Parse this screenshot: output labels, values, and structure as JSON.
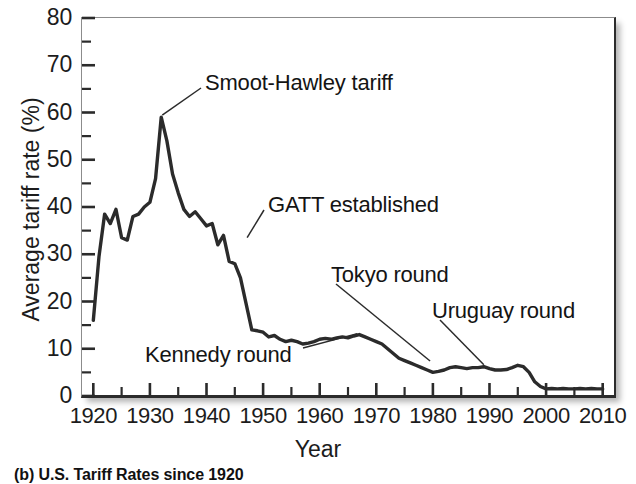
{
  "figure": {
    "caption": "(b)  U.S. Tariff Rates since 1920"
  },
  "axes": {
    "y_title": "Average tariff rate (%)",
    "x_title": "Year",
    "y_ticks": [
      "0",
      "10",
      "20",
      "30",
      "40",
      "50",
      "60",
      "70",
      "80"
    ],
    "x_ticks": [
      "1920",
      "1930",
      "1940",
      "1950",
      "1960",
      "1970",
      "1980",
      "1990",
      "2000",
      "2010"
    ]
  },
  "annotations": [
    {
      "id": "smoot-hawley",
      "label": "Smoot-Hawley tariff",
      "year": 1932,
      "value": 59
    },
    {
      "id": "gatt",
      "label": "GATT established",
      "year": 1947,
      "value": 33
    },
    {
      "id": "kennedy",
      "label": "Kennedy round",
      "year": 1967,
      "value": 12
    },
    {
      "id": "tokyo",
      "label": "Tokyo round",
      "year": 1979,
      "value": 7
    },
    {
      "id": "uruguay",
      "label": "Uruguay round",
      "year": 1989,
      "value": 6
    }
  ],
  "chart_data": {
    "type": "line",
    "title": "",
    "subtitle": "",
    "xlabel": "Year",
    "ylabel": "Average tariff rate (%)",
    "xlim": [
      1918,
      2012
    ],
    "ylim": [
      0,
      80
    ],
    "ytick_step": 10,
    "ytick_minor_step": 5,
    "xtick_step": 10,
    "xtick_minor_step": 5,
    "grid": false,
    "legend": "none",
    "line_color": "#2b2b2b",
    "series": [
      {
        "name": "U.S. average tariff rate",
        "x": [
          1920,
          1921,
          1922,
          1923,
          1924,
          1925,
          1926,
          1927,
          1928,
          1929,
          1930,
          1931,
          1932,
          1933,
          1934,
          1935,
          1936,
          1937,
          1938,
          1939,
          1940,
          1941,
          1942,
          1943,
          1944,
          1945,
          1946,
          1947,
          1948,
          1949,
          1950,
          1951,
          1952,
          1953,
          1954,
          1955,
          1956,
          1957,
          1958,
          1959,
          1960,
          1961,
          1962,
          1963,
          1964,
          1965,
          1966,
          1967,
          1968,
          1969,
          1970,
          1971,
          1972,
          1973,
          1974,
          1975,
          1976,
          1977,
          1978,
          1979,
          1980,
          1981,
          1982,
          1983,
          1984,
          1985,
          1986,
          1987,
          1988,
          1989,
          1990,
          1991,
          1992,
          1993,
          1994,
          1995,
          1996,
          1997,
          1998,
          1999,
          2000,
          2001,
          2002,
          2003,
          2004,
          2005,
          2006,
          2007,
          2008,
          2009,
          2010
        ],
        "values": [
          16.0,
          29.5,
          38.5,
          36.5,
          39.5,
          33.5,
          33.0,
          38.0,
          38.5,
          40.0,
          41.0,
          46.0,
          59.0,
          54.0,
          47.0,
          43.0,
          39.5,
          38.0,
          39.0,
          37.5,
          36.0,
          36.5,
          32.0,
          34.0,
          28.5,
          28.0,
          25.0,
          19.5,
          14.0,
          13.8,
          13.5,
          12.5,
          12.8,
          12.0,
          11.5,
          11.8,
          11.5,
          11.0,
          11.2,
          11.5,
          12.0,
          12.2,
          12.0,
          12.3,
          12.5,
          12.3,
          12.7,
          13.0,
          12.5,
          12.0,
          11.5,
          11.0,
          10.0,
          9.0,
          8.0,
          7.5,
          7.0,
          6.5,
          6.0,
          5.5,
          5.0,
          5.2,
          5.5,
          6.0,
          6.2,
          6.0,
          5.8,
          6.0,
          6.0,
          6.2,
          5.8,
          5.5,
          5.5,
          5.6,
          6.0,
          6.5,
          6.2,
          5.0,
          3.0,
          2.0,
          1.5,
          1.6,
          1.5,
          1.6,
          1.5,
          1.5,
          1.6,
          1.5,
          1.6,
          1.5,
          1.5
        ]
      }
    ]
  }
}
